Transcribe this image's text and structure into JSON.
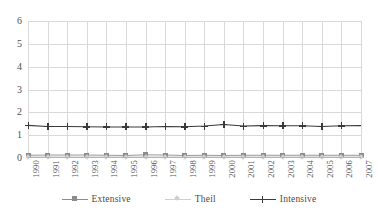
{
  "chart_data": {
    "type": "line",
    "title": "",
    "xlabel": "",
    "ylabel": "",
    "ylim": [
      0,
      6
    ],
    "yticks": [
      0,
      1,
      2,
      3,
      4,
      5,
      6
    ],
    "grid": "both",
    "legend_position": "bottom",
    "categories": [
      "1990",
      "1991",
      "1992",
      "1993",
      "1994",
      "1995",
      "1996",
      "1997",
      "1998",
      "1999",
      "2000",
      "2001",
      "2002",
      "2003",
      "2004",
      "2005",
      "2006",
      "2007"
    ],
    "series": [
      {
        "name": "Extensive",
        "marker": "square",
        "color": "#8c8c8c",
        "values": [
          0.12,
          0.13,
          0.13,
          0.13,
          0.12,
          0.11,
          0.14,
          0.13,
          0.11,
          0.12,
          0.11,
          0.12,
          0.12,
          0.12,
          0.12,
          0.12,
          0.12,
          0.12
        ]
      },
      {
        "name": "Theil",
        "marker": "diamond",
        "color": "#cfcfcf",
        "values": [
          0.05,
          0.05,
          0.05,
          0.05,
          0.05,
          0.05,
          0.05,
          0.05,
          0.05,
          0.05,
          0.05,
          0.05,
          0.05,
          0.05,
          0.05,
          0.05,
          0.05,
          0.05
        ]
      },
      {
        "name": "Intensive",
        "marker": "cross",
        "color": "#3a3a3a",
        "values": [
          1.43,
          1.38,
          1.38,
          1.37,
          1.36,
          1.36,
          1.36,
          1.38,
          1.37,
          1.4,
          1.47,
          1.4,
          1.42,
          1.41,
          1.41,
          1.38,
          1.41,
          1.42
        ]
      }
    ]
  },
  "legend": {
    "items": [
      {
        "label": "Extensive"
      },
      {
        "label": "Theil"
      },
      {
        "label": "Intensive"
      }
    ]
  }
}
